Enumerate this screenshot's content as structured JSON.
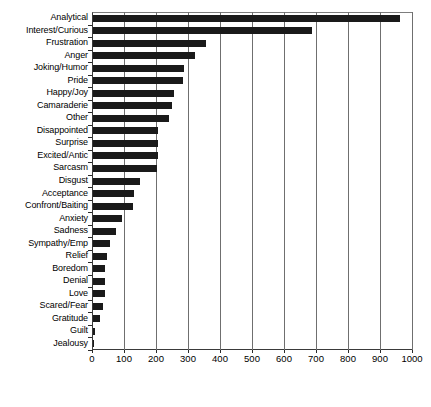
{
  "chart_data": {
    "type": "bar",
    "orientation": "horizontal",
    "title": "",
    "xlabel": "",
    "ylabel": "",
    "xlim": [
      0,
      1000
    ],
    "xticks": [
      0,
      100,
      200,
      300,
      400,
      500,
      600,
      700,
      800,
      900,
      1000
    ],
    "grid": true,
    "legend": false,
    "bar_color": "#1a1a1a",
    "background_color": "#ffffff",
    "categories": [
      "Analytical",
      "Interest/Curious",
      "Frustration",
      "Anger",
      "Joking/Humor",
      "Pride",
      "Happy/Joy",
      "Camaraderie",
      "Other",
      "Disappointed",
      "Surprise",
      "Excited/Antic",
      "Sarcasm",
      "Disgust",
      "Acceptance",
      "Confront/Baiting",
      "Anxiety",
      "Sadness",
      "Sympathy/Emp",
      "Relief",
      "Boredom",
      "Denial",
      "Love",
      "Scared/Fear",
      "Gratitude",
      "Guilt",
      "Jealousy"
    ],
    "values": [
      960,
      685,
      353,
      319,
      284,
      281,
      253,
      246,
      238,
      203,
      203,
      203,
      201,
      147,
      128,
      125,
      91,
      72,
      53,
      44,
      38,
      38,
      38,
      31,
      22,
      5,
      3
    ]
  }
}
